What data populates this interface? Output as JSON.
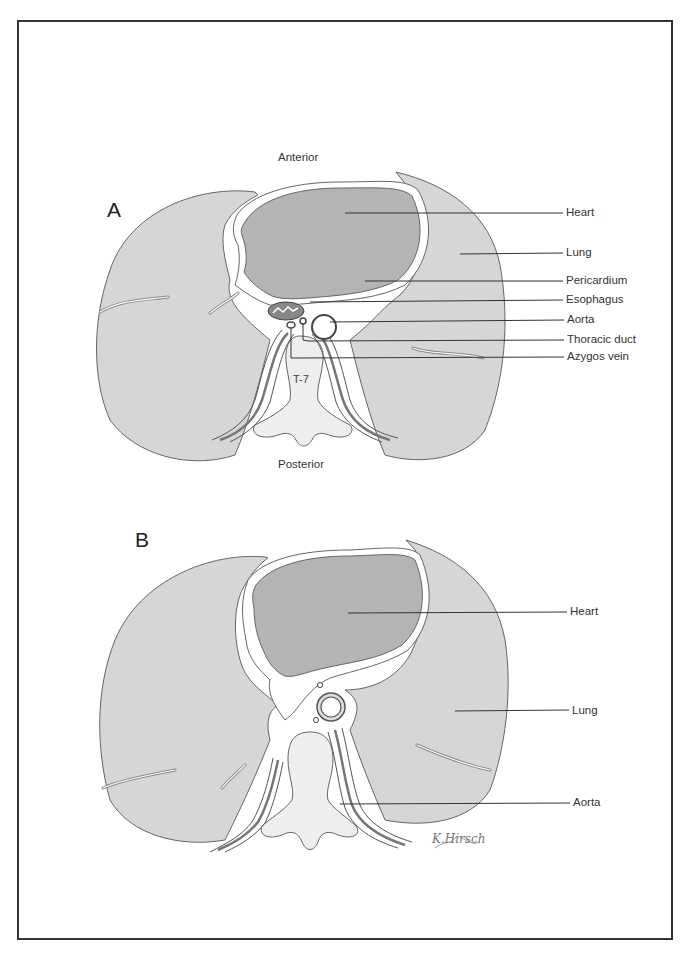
{
  "figure": {
    "panels": [
      {
        "id": "A",
        "letter": "A",
        "orientation": {
          "top": "Anterior",
          "bottom": "Posterior"
        },
        "vertebra_label": "T-7",
        "labels": [
          {
            "text": "Heart"
          },
          {
            "text": "Lung"
          },
          {
            "text": "Pericardium"
          },
          {
            "text": "Esophagus"
          },
          {
            "text": "Aorta"
          },
          {
            "text": "Thoracic duct"
          },
          {
            "text": "Azygos vein"
          }
        ]
      },
      {
        "id": "B",
        "letter": "B",
        "labels": [
          {
            "text": "Heart"
          },
          {
            "text": "Lung"
          },
          {
            "text": "Aorta"
          }
        ],
        "signature": "K.Hirsch"
      }
    ],
    "colors": {
      "heart_fill": "#b4b4b4",
      "lung_fill": "#d6d6d6",
      "outline": "#555555",
      "frame": "#333333",
      "background": "#ffffff"
    }
  }
}
